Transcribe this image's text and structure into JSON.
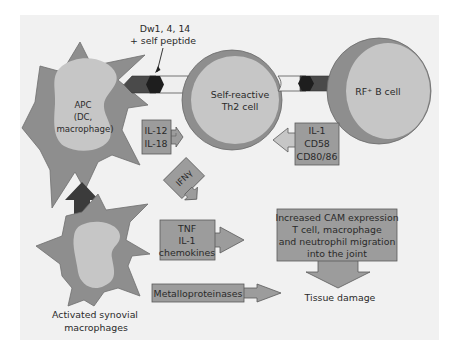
{
  "colors": {
    "background": "#ffffff",
    "panel": "#f1f1f1",
    "cell_outer": "#8e8e8e",
    "cell_inner": "#c6c6c6",
    "box_fill": "#9c9c9c",
    "box_stroke": "#5a5a5a",
    "dark_arrow": "#3b3b3b",
    "receptor_dark": "#4a4a4a",
    "receptor_light": "#efefef",
    "text": "#2a2a2a"
  },
  "labels": {
    "mhc_line1": "Dw1, 4, 14",
    "mhc_line2": "+ self peptide",
    "apc_line1": "APC",
    "apc_line2": "(DC,",
    "apc_line3": "macrophage)",
    "th2_line1": "Self-reactive",
    "th2_line2": "Th2 cell",
    "bcell": "RF⁺ B cell",
    "synovial_line1": "Activated synovial",
    "synovial_line2": "macrophages",
    "tissue_damage": "Tissue damage"
  },
  "boxes": {
    "il12_18": {
      "line1": "IL-12",
      "line2": "IL-18"
    },
    "il1_cd": {
      "line1": "IL-1",
      "line2": "CD58",
      "line3": "CD80/86"
    },
    "ifn": {
      "line1": "IFNγ"
    },
    "tnf": {
      "line1": "TNF",
      "line2": "IL-1",
      "line3": "chemokines"
    },
    "cam": {
      "line1": "Increased CAM expression",
      "line2": "T cell, macrophage",
      "line3": "and neutrophil migration",
      "line4": "into the joint"
    },
    "mmp": {
      "line1": "Metalloproteinases"
    }
  }
}
